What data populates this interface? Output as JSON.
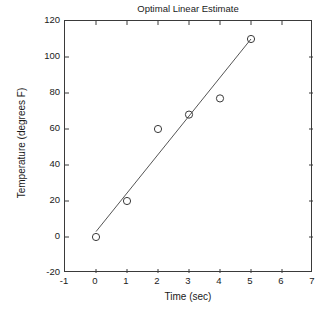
{
  "chart_data": {
    "type": "scatter",
    "title": "Optimal Linear Estimate",
    "xlabel": "Time (sec)",
    "ylabel": "Temperature (degrees F)",
    "xlim": [
      -1,
      7
    ],
    "ylim": [
      -20,
      120
    ],
    "xticks": [
      -1,
      0,
      1,
      2,
      3,
      4,
      5,
      6,
      7
    ],
    "xticklabels": [
      "-1",
      "0",
      "1",
      "2",
      "3",
      "4",
      "5",
      "6",
      "7"
    ],
    "yticks": [
      -20,
      0,
      20,
      40,
      60,
      80,
      100,
      120
    ],
    "yticklabels": [
      "-20",
      "0",
      "20",
      "40",
      "60",
      "80",
      "100",
      "120"
    ],
    "grid": false,
    "legend": null,
    "marker": "open-circle",
    "marker_color": "#3a3a3a",
    "line_color": "#555555",
    "axis_color": "#3a3a3a",
    "background": "#ffffff",
    "x": [
      0,
      1,
      2,
      3,
      4,
      5
    ],
    "y": [
      0,
      20,
      60,
      68,
      77,
      110
    ],
    "points": [
      {
        "x": 0,
        "y": 0
      },
      {
        "x": 1,
        "y": 20
      },
      {
        "x": 2,
        "y": 60
      },
      {
        "x": 3,
        "y": 68
      },
      {
        "x": 4,
        "y": 77
      },
      {
        "x": 5,
        "y": 110
      }
    ],
    "series": [
      {
        "name": "Measurements",
        "type": "scatter",
        "x": [
          0,
          1,
          2,
          3,
          4,
          5
        ],
        "values": [
          0,
          20,
          60,
          68,
          77,
          110
        ]
      },
      {
        "name": "Optimal linear estimate",
        "type": "line",
        "x": [
          0,
          5
        ],
        "values": [
          3,
          110
        ]
      }
    ],
    "fit_line": {
      "x_start": 0,
      "y_start": 3,
      "x_end": 5,
      "y_end": 110,
      "slope": 21.4,
      "intercept": 3
    }
  }
}
